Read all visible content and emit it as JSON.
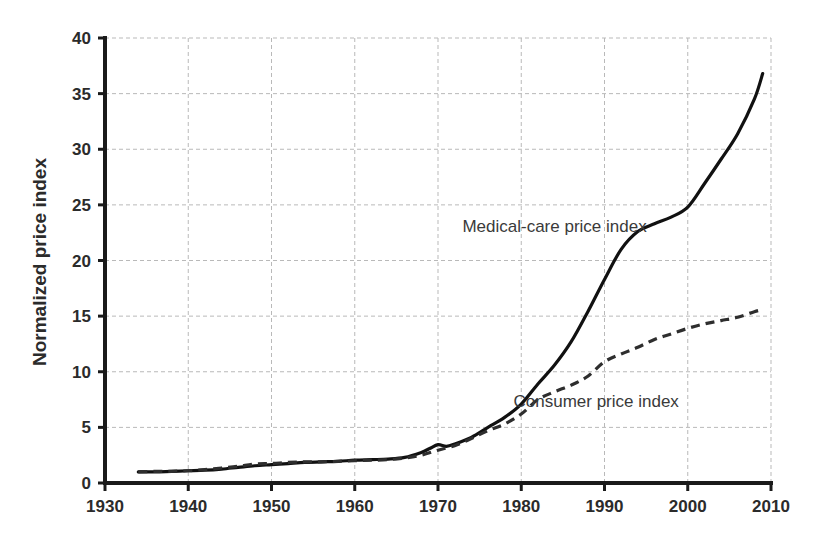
{
  "chart_data": {
    "type": "line",
    "title": "",
    "xlabel": "",
    "ylabel": "Normalized price index",
    "xlim": [
      1930,
      2010
    ],
    "ylim": [
      0,
      40
    ],
    "grid": true,
    "legend_position": "inline-annotation",
    "x_ticks": [
      "1930",
      "1940",
      "1950",
      "1960",
      "1970",
      "1980",
      "1990",
      "2000",
      "2010"
    ],
    "y_ticks": [
      "0",
      "5",
      "10",
      "15",
      "20",
      "25",
      "30",
      "35",
      "40"
    ],
    "annotations": [
      {
        "text": "Medical-care price index",
        "x": 1984,
        "y": 22.6
      },
      {
        "text": "Consumer price index",
        "x": 1989,
        "y": 6.8
      }
    ],
    "series": [
      {
        "name": "Medical-care price index",
        "style": "solid",
        "color": "#111111",
        "x": [
          1934,
          1936,
          1938,
          1940,
          1942,
          1944,
          1946,
          1948,
          1950,
          1952,
          1954,
          1956,
          1958,
          1960,
          1962,
          1964,
          1966,
          1968,
          1969,
          1970,
          1971,
          1972,
          1974,
          1976,
          1978,
          1980,
          1982,
          1984,
          1986,
          1988,
          1990,
          1992,
          1994,
          1996,
          1998,
          2000,
          2002,
          2004,
          2006,
          2008,
          2009
        ],
        "values": [
          1.0,
          1.0,
          1.05,
          1.1,
          1.15,
          1.25,
          1.4,
          1.55,
          1.65,
          1.75,
          1.85,
          1.9,
          1.95,
          2.05,
          2.1,
          2.15,
          2.3,
          2.75,
          3.1,
          3.45,
          3.3,
          3.5,
          4.1,
          5.0,
          5.9,
          7.1,
          8.9,
          10.6,
          12.7,
          15.4,
          18.3,
          21.0,
          22.6,
          23.3,
          23.9,
          24.8,
          26.9,
          29.1,
          31.4,
          34.5,
          36.8
        ]
      },
      {
        "name": "Consumer price index",
        "style": "dashed",
        "color": "#2e2e2e",
        "x": [
          1934,
          1936,
          1938,
          1940,
          1942,
          1944,
          1946,
          1948,
          1950,
          1952,
          1954,
          1956,
          1958,
          1960,
          1962,
          1964,
          1966,
          1968,
          1970,
          1972,
          1974,
          1976,
          1978,
          1980,
          1982,
          1984,
          1986,
          1988,
          1990,
          1992,
          1994,
          1996,
          1998,
          2000,
          2002,
          2004,
          2006,
          2008,
          2009
        ],
        "values": [
          1.0,
          1.05,
          1.05,
          1.1,
          1.2,
          1.35,
          1.5,
          1.7,
          1.75,
          1.85,
          1.9,
          1.9,
          1.95,
          2.0,
          2.05,
          2.1,
          2.25,
          2.5,
          2.95,
          3.35,
          4.0,
          4.7,
          5.3,
          6.2,
          7.5,
          8.2,
          8.8,
          9.6,
          10.9,
          11.6,
          12.2,
          12.9,
          13.4,
          13.9,
          14.3,
          14.6,
          14.9,
          15.4,
          15.6
        ]
      }
    ]
  }
}
